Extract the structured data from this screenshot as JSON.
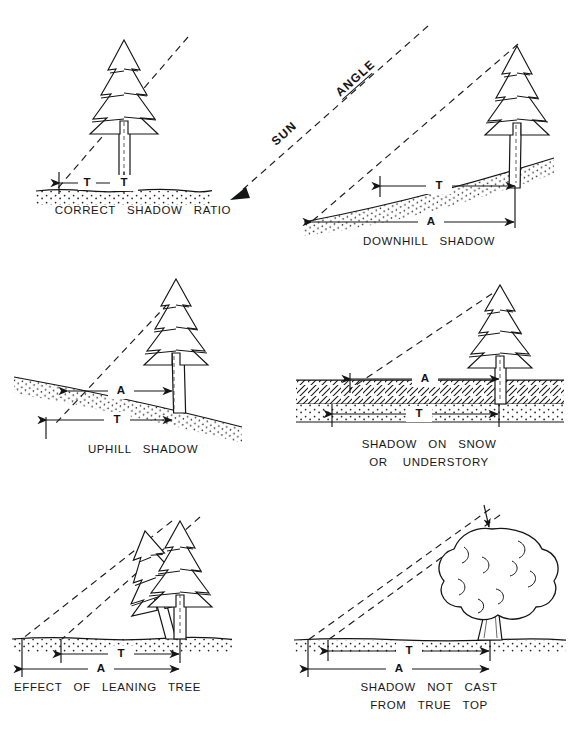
{
  "figure": {
    "title_clipped_top": "",
    "caption_clipped_bottom": "",
    "sun_label_line": "SUN ANGLE",
    "sun_word_1": "SUN",
    "sun_word_2": "ANGLE",
    "ink_color": "#141414",
    "background_color": "#ffffff"
  },
  "symbols": {
    "tree_height_shadow": "T",
    "apparent_shadow": "A"
  },
  "panels": [
    {
      "id": "correct-shadow-ratio",
      "caption_lines": [
        "CORRECT   SHADOW   RATIO"
      ],
      "dimensions": [
        "T"
      ],
      "ground": "flat-stippled",
      "tree": "conifer-upright"
    },
    {
      "id": "downhill-shadow",
      "caption_lines": [
        "DOWNHILL   SHADOW"
      ],
      "dimensions": [
        "T",
        "A"
      ],
      "ground": "slope-down-left-stippled",
      "tree": "conifer-upright"
    },
    {
      "id": "uphill-shadow",
      "caption_lines": [
        "UPHILL   SHADOW"
      ],
      "dimensions": [
        "A",
        "T"
      ],
      "ground": "slope-down-right-stippled",
      "tree": "conifer-upright"
    },
    {
      "id": "shadow-on-snow-or-understory",
      "caption_lines": [
        "SHADOW   ON   SNOW",
        "OR    UNDERSTORY"
      ],
      "dimensions": [
        "A",
        "T"
      ],
      "ground": "flat-hatched-snow-over-stipple",
      "tree": "conifer-upright"
    },
    {
      "id": "effect-of-leaning-tree",
      "caption_lines": [
        "EFFECT   OF   LEANING   TREE"
      ],
      "dimensions": [
        "T",
        "A"
      ],
      "ground": "flat-stippled",
      "tree": "conifer-pair-one-leaning"
    },
    {
      "id": "shadow-not-cast-from-true-top",
      "caption_lines": [
        "SHADOW   NOT   CAST",
        "FROM   TRUE   TOP"
      ],
      "dimensions": [
        "T",
        "A"
      ],
      "ground": "flat-stippled",
      "tree": "broadleaf-round-crown"
    }
  ]
}
